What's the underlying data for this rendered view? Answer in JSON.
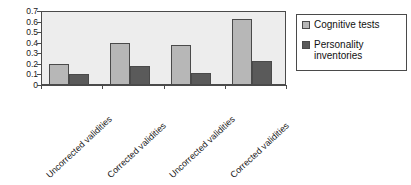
{
  "chart_data": {
    "type": "bar",
    "title": "",
    "xlabel": "",
    "ylabel": "",
    "ylim": [
      0,
      0.7
    ],
    "grid": false,
    "legend_position": "right",
    "categories": [
      "Uncorrected validities",
      "Corrected validities",
      "Uncorrected validities",
      "Corrected validities"
    ],
    "y_ticks": [
      "0",
      "0.1",
      "0.2",
      "0.3",
      "0.4",
      "0.5",
      "0.6",
      "0.7"
    ],
    "y_tick_values": [
      0,
      0.1,
      0.2,
      0.3,
      0.4,
      0.5,
      0.6,
      0.7
    ],
    "series": [
      {
        "name": "Cognitive tests",
        "color": "#b7b7b7",
        "values": [
          0.2,
          0.4,
          0.38,
          0.62
        ]
      },
      {
        "name": "Personality inventories",
        "color": "#5a5a5a",
        "values": [
          0.1,
          0.18,
          0.11,
          0.23
        ]
      }
    ]
  },
  "legend": {
    "items": [
      {
        "label": "Cognitive tests",
        "swatch": "cog"
      },
      {
        "label": "Personality inventories",
        "swatch": "per"
      }
    ]
  },
  "colors": {
    "plot_background": "#ededed",
    "axis": "#4a4a4a",
    "cognitive": "#b7b7b7",
    "personality": "#5a5a5a",
    "page_background": "#ffffff"
  }
}
